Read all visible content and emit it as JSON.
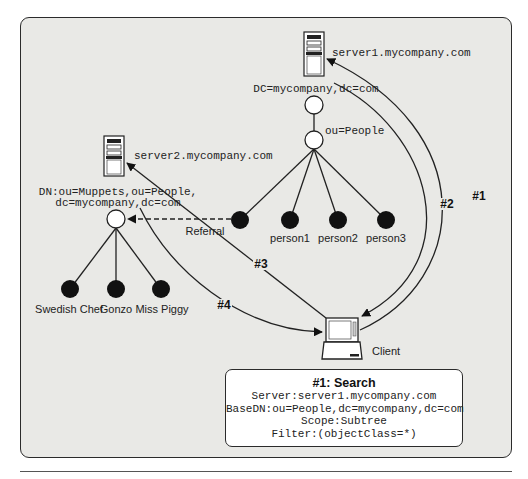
{
  "diagram": {
    "server1": {
      "label": "server1.mycompany.com",
      "dn": "DC=mycompany,dc=com",
      "ou_label": "ou=People",
      "people": [
        "person1",
        "person2",
        "person3"
      ]
    },
    "server2": {
      "label": "server2.mycompany.com",
      "dn_line1": "DN:ou=Muppets,ou=People,",
      "dn_line2": "dc=mycompany,dc=com",
      "people": [
        "Swedish Chef",
        "Gonzo",
        "Miss Piggy"
      ]
    },
    "referral_label": "Referral",
    "client_label": "Client",
    "steps": [
      "#1",
      "#2",
      "#3",
      "#4"
    ],
    "search_box": {
      "title": "#1: Search",
      "server": "Server:server1.mycompany.com",
      "base_dn": "BaseDN:ou=People,dc=mycompany,dc=com",
      "scope": "Scope:Subtree",
      "filter": "Filter:(objectClass=*)"
    },
    "colors": {
      "panel_bg": "#e9e9e6",
      "stroke": "#2b2b2b",
      "node_filled": "#111111",
      "node_empty": "#ffffff"
    }
  }
}
